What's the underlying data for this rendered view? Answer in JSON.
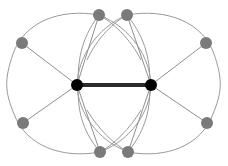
{
  "figure": {
    "width": 228,
    "height": 166,
    "background_color": "#ffffff"
  },
  "style": {
    "hub_node_color": "#000000",
    "leaf_node_color": "#7a7a7a",
    "hub_edge_color": "#2b2b2b",
    "spoke_edge_color": "#8f8f8f",
    "arc_edge_color": "#9a9a9a",
    "hub_node_radius": 6,
    "leaf_node_radius": 6,
    "hub_edge_width": 4,
    "spoke_edge_width": 1,
    "arc_edge_width": 1
  },
  "nodes": {
    "hubs": [
      {
        "id": "hub-left",
        "label": "",
        "x": 77,
        "y": 85,
        "r": 6,
        "color": "#000000"
      },
      {
        "id": "hub-right",
        "label": "",
        "x": 151,
        "y": 85,
        "r": 6,
        "color": "#000000"
      }
    ],
    "leaves": [
      {
        "id": "leaf-left-top-outer",
        "label": "",
        "x": 22,
        "y": 43,
        "r": 6,
        "color": "#7a7a7a"
      },
      {
        "id": "leaf-left-top-inner",
        "label": "",
        "x": 99,
        "y": 15,
        "r": 6,
        "color": "#7a7a7a"
      },
      {
        "id": "leaf-right-top-inner",
        "label": "",
        "x": 127,
        "y": 15,
        "r": 6,
        "color": "#7a7a7a"
      },
      {
        "id": "leaf-right-top-outer",
        "label": "",
        "x": 206,
        "y": 43,
        "r": 6,
        "color": "#7a7a7a"
      },
      {
        "id": "leaf-left-bottom-outer",
        "label": "",
        "x": 23,
        "y": 123,
        "r": 6,
        "color": "#7a7a7a"
      },
      {
        "id": "leaf-left-bottom-inner",
        "label": "",
        "x": 100,
        "y": 152,
        "r": 6,
        "color": "#7a7a7a"
      },
      {
        "id": "leaf-right-bottom-inner",
        "label": "",
        "x": 128,
        "y": 152,
        "r": 6,
        "color": "#7a7a7a"
      },
      {
        "id": "leaf-right-bottom-outer",
        "label": "",
        "x": 207,
        "y": 123,
        "r": 6,
        "color": "#7a7a7a"
      }
    ]
  },
  "edges": {
    "hub_edge": {
      "from": "hub-left",
      "to": "hub-right",
      "style": "thick-straight",
      "color": "#2b2b2b"
    },
    "spokes": [
      {
        "from": "hub-left",
        "to": "leaf-left-top-outer"
      },
      {
        "from": "hub-left",
        "to": "leaf-left-top-inner"
      },
      {
        "from": "hub-left",
        "to": "leaf-left-bottom-outer"
      },
      {
        "from": "hub-left",
        "to": "leaf-left-bottom-inner"
      },
      {
        "from": "hub-right",
        "to": "leaf-right-top-inner"
      },
      {
        "from": "hub-right",
        "to": "leaf-right-top-outer"
      },
      {
        "from": "hub-right",
        "to": "leaf-right-bottom-inner"
      },
      {
        "from": "hub-right",
        "to": "leaf-right-bottom-outer"
      }
    ],
    "arcs": [
      {
        "id": "arc-left-outer-ring",
        "description": "left outer ellipse through left leaves"
      },
      {
        "id": "arc-right-outer-ring",
        "description": "right outer ellipse through right leaves"
      },
      {
        "id": "arc-left-hub-lens",
        "description": "lens arc from left hub through inner leaves"
      },
      {
        "id": "arc-right-hub-lens",
        "description": "lens arc from right hub through inner leaves"
      },
      {
        "id": "arc-cross-upper",
        "description": "crossing arcs near top inner leaves"
      },
      {
        "id": "arc-cross-lower",
        "description": "crossing arcs near bottom inner leaves"
      }
    ]
  }
}
